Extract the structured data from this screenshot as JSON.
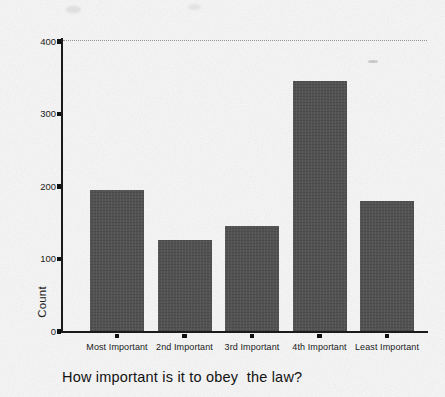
{
  "figure": {
    "caption": "How important is it to obey  the law?"
  },
  "chart_data": {
    "type": "bar",
    "title": "",
    "categories": [
      "Most Important",
      "2nd Important",
      "3rd Important",
      "4th Important",
      "Least Important"
    ],
    "values": [
      195,
      125,
      145,
      345,
      180
    ],
    "xlabel": "How important is it to obey  the law?",
    "ylabel": "Count",
    "ylim": [
      0,
      400
    ],
    "yticks": [
      0,
      100,
      200,
      300,
      400
    ],
    "grid": "dotted reference line at y=400 only",
    "legend_position": "none",
    "bar_color": "#575757",
    "axis_color": "#1c1c1c",
    "background_color": "#ffffff"
  }
}
